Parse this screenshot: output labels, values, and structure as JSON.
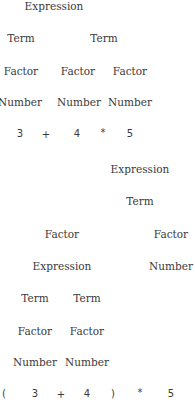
{
  "tree1": {
    "expression": "3 + 4 * 5",
    "nodes": [
      {
        "label": "Expression",
        "x": 54,
        "y": 6
      },
      {
        "label": "Term",
        "x": 21,
        "y": 38
      },
      {
        "label": "Term",
        "x": 104,
        "y": 38
      },
      {
        "label": "Factor",
        "x": 21,
        "y": 71
      },
      {
        "label": "Factor",
        "x": 78,
        "y": 71
      },
      {
        "label": "Factor",
        "x": 130,
        "y": 71
      },
      {
        "label": "Number",
        "x": 20,
        "y": 102
      },
      {
        "label": "Number",
        "x": 79,
        "y": 102
      },
      {
        "label": "Number",
        "x": 130,
        "y": 102
      }
    ],
    "tokens": [
      {
        "label": "3",
        "x": 20,
        "y": 134
      },
      {
        "label": "+",
        "x": 46,
        "y": 135
      },
      {
        "label": "4",
        "x": 77,
        "y": 134
      },
      {
        "label": "*",
        "x": 103,
        "y": 133
      },
      {
        "label": "5",
        "x": 130,
        "y": 134
      }
    ]
  },
  "tree2": {
    "expression": "( 3 + 4 ) * 5",
    "nodes": [
      {
        "label": "Expression",
        "x": 140,
        "y": 169
      },
      {
        "label": "Term",
        "x": 140,
        "y": 201
      },
      {
        "label": "Factor",
        "x": 62,
        "y": 234
      },
      {
        "label": "Factor",
        "x": 171,
        "y": 234
      },
      {
        "label": "Expression",
        "x": 62,
        "y": 266
      },
      {
        "label": "Number",
        "x": 171,
        "y": 266
      },
      {
        "label": "Term",
        "x": 35,
        "y": 298
      },
      {
        "label": "Term",
        "x": 87,
        "y": 298
      },
      {
        "label": "Factor",
        "x": 35,
        "y": 331
      },
      {
        "label": "Factor",
        "x": 87,
        "y": 331
      },
      {
        "label": "Number",
        "x": 35,
        "y": 362
      },
      {
        "label": "Number",
        "x": 87,
        "y": 362
      }
    ],
    "tokens": [
      {
        "label": "(",
        "x": 4,
        "y": 394
      },
      {
        "label": "3",
        "x": 35,
        "y": 394
      },
      {
        "label": "+",
        "x": 61,
        "y": 395
      },
      {
        "label": "4",
        "x": 87,
        "y": 394
      },
      {
        "label": ")",
        "x": 113,
        "y": 394
      },
      {
        "label": "*",
        "x": 140,
        "y": 393
      },
      {
        "label": "5",
        "x": 171,
        "y": 394
      }
    ]
  }
}
